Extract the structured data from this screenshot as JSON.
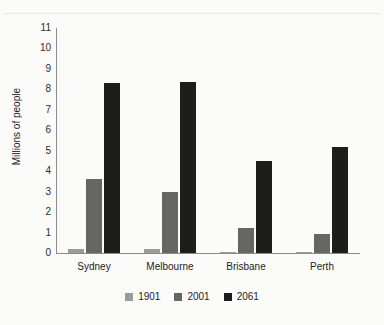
{
  "chart_data": {
    "type": "bar",
    "title": "",
    "subtitle": "",
    "xlabel": "",
    "ylabel": "Millions of people",
    "categories": [
      "Sydney",
      "Melbourne",
      "Brisbane",
      "Perth"
    ],
    "series": [
      {
        "name": "1901",
        "color": "#9b9b9b",
        "values": [
          0.2,
          0.2,
          0.06,
          0.07
        ]
      },
      {
        "name": "2001",
        "color": "#666664",
        "values": [
          3.6,
          3.0,
          1.2,
          0.95
        ]
      },
      {
        "name": "2061",
        "color": "#1d1d1b",
        "values": [
          8.3,
          8.35,
          4.5,
          5.2
        ]
      }
    ],
    "ylim": [
      0,
      11
    ],
    "yticks": [
      0,
      1,
      2,
      3,
      4,
      5,
      6,
      7,
      8,
      9,
      10,
      11
    ],
    "ytick_labels": [
      "0",
      "1",
      "2",
      "3",
      "4",
      "5",
      "6",
      "7",
      "8",
      "9",
      "10",
      "11"
    ],
    "grid": false,
    "legend_position": "bottom-center",
    "background_color": "#fbfbfa",
    "axis_color": "#8a8a88"
  },
  "legend": {
    "items": [
      {
        "label": "1901"
      },
      {
        "label": "2001"
      },
      {
        "label": "2061"
      }
    ]
  }
}
